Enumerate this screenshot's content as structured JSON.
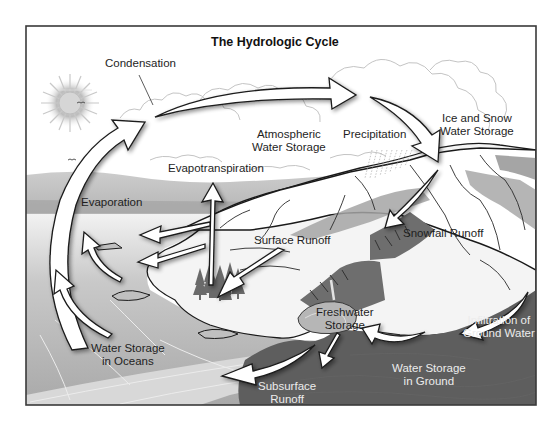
{
  "diagram": {
    "title": "The Hydrologic Cycle",
    "colors": {
      "frame": "#3a3a3a",
      "sky": "#ffffff",
      "ocean": "#b3b3b3",
      "ocean_light": "#d4d4d4",
      "ground": "#5e5e5e",
      "mountain_shade": "#9c9c9c",
      "mountain_dark": "#6e6e6e",
      "haze": "#c6c6c6",
      "trees": "#6a6a6a",
      "arrow_fill": "#ffffff",
      "arrow_stroke": "#1a1a1a"
    },
    "labels": {
      "condensation": "Condensation",
      "atmospheric_line1": "Atmospheric",
      "atmospheric_line2": "Water Storage",
      "precipitation": "Precipitation",
      "ice_snow_line1": "Ice and Snow",
      "ice_snow_line2": "Water Storage",
      "evapotranspiration": "Evapotranspiration",
      "evaporation": "Evaporation",
      "surface_runoff": "Surface Runoff",
      "snowfall_runoff": "Snowfall Runoff",
      "freshwater_line1": "Freshwater",
      "freshwater_line2": "Storage",
      "infiltration_line1": "Infiltration of",
      "infiltration_line2": "Ground Water",
      "ocean_storage_line1": "Water Storage",
      "ocean_storage_line2": "in Oceans",
      "ground_storage_line1": "Water Storage",
      "ground_storage_line2": "in Ground",
      "subsurface_line1": "Subsurface",
      "subsurface_line2": "Runoff"
    },
    "icons": [
      "sun-icon",
      "birds-icon",
      "clouds-icon",
      "rain-icon",
      "trees-icon",
      "mountain-icon"
    ]
  }
}
